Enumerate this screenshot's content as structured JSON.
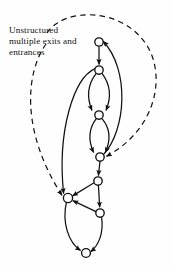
{
  "figure": {
    "caption": "Unstructured\nmultiple exits and\nentrances",
    "caption_name": "unstructured-multiple-exits-and-entrances-label",
    "background_color": "#fefefe",
    "ink_color": "#111111"
  },
  "chart_data": {
    "type": "diagram",
    "title": "Unstructured multiple exits and entrances",
    "nodes": [
      {
        "id": "A",
        "label": "",
        "x": 99,
        "y": 42
      },
      {
        "id": "B",
        "label": "",
        "x": 99,
        "y": 70
      },
      {
        "id": "C",
        "label": "",
        "x": 99,
        "y": 115
      },
      {
        "id": "D",
        "label": "",
        "x": 100,
        "y": 157
      },
      {
        "id": "E",
        "label": "",
        "x": 98,
        "y": 181
      },
      {
        "id": "F",
        "label": "",
        "x": 68,
        "y": 198
      },
      {
        "id": "G",
        "label": "",
        "x": 100,
        "y": 213
      },
      {
        "id": "H",
        "label": "",
        "x": 86,
        "y": 253
      }
    ],
    "node_radius": 4.2,
    "edges": [
      {
        "from": "A",
        "to": "B",
        "style": "solid",
        "shape": "straight"
      },
      {
        "from": "B",
        "to": "C",
        "style": "solid",
        "shape": "arc-left"
      },
      {
        "from": "B",
        "to": "C",
        "style": "solid",
        "shape": "arc-right"
      },
      {
        "from": "C",
        "to": "D",
        "style": "solid",
        "shape": "arc-left"
      },
      {
        "from": "C",
        "to": "D",
        "style": "solid",
        "shape": "arc-right"
      },
      {
        "from": "D",
        "to": "A",
        "style": "solid",
        "shape": "back-edge-right"
      },
      {
        "from": "B",
        "to": "F",
        "style": "solid",
        "shape": "long-left-sweep"
      },
      {
        "from": "D",
        "to": "E",
        "style": "solid",
        "shape": "straight"
      },
      {
        "from": "E",
        "to": "F",
        "style": "solid",
        "shape": "straight"
      },
      {
        "from": "E",
        "to": "G",
        "style": "solid",
        "shape": "straight"
      },
      {
        "from": "G",
        "to": "F",
        "style": "solid",
        "shape": "straight"
      },
      {
        "from": "F",
        "to": "H",
        "style": "solid",
        "shape": "arc-left"
      },
      {
        "from": "G",
        "to": "H",
        "style": "solid",
        "shape": "arc-right"
      },
      {
        "from": "external",
        "to": "D",
        "style": "dashed",
        "shape": "over-the-top-right"
      },
      {
        "from": "external",
        "to": "F",
        "style": "dashed",
        "shape": "down-the-left"
      }
    ],
    "legend": [],
    "grid": false
  }
}
